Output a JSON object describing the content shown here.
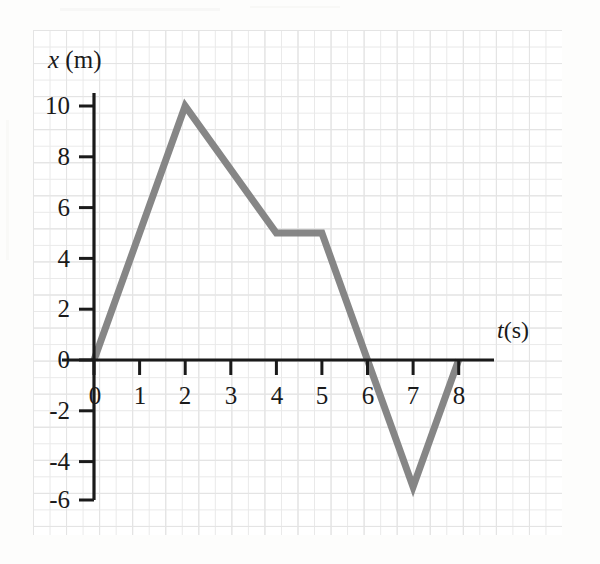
{
  "figure": {
    "type": "position-time-graph",
    "background_color": "#fdfdfc",
    "grid_color": "#dcdcdc",
    "axis_color": "#1a1a1a",
    "curve_color": "#808080"
  },
  "axes": {
    "y_axis_label": "x (m)",
    "y_axis_variable": "x",
    "y_axis_unit": "(m)",
    "x_axis_label": "t (s)",
    "x_axis_variable": "t",
    "x_axis_unit": "(s)"
  },
  "ticks": {
    "y": [
      "10",
      "8",
      "6",
      "4",
      "2",
      "0",
      "-2",
      "-4",
      "-6"
    ],
    "x": [
      "0",
      "1",
      "2",
      "3",
      "4",
      "5",
      "6",
      "7",
      "8"
    ]
  },
  "chart_data": {
    "type": "line",
    "title": "",
    "subtitle": "",
    "xlabel": "t (s)",
    "ylabel": "x (m)",
    "xlim": [
      -1,
      8.6
    ],
    "ylim": [
      -6.5,
      11
    ],
    "xticks": [
      0,
      1,
      2,
      3,
      4,
      5,
      6,
      7,
      8
    ],
    "yticks": [
      -6,
      -4,
      -2,
      0,
      2,
      4,
      6,
      8,
      10
    ],
    "grid": true,
    "minor_grid": true,
    "legend": null,
    "legend_position": "none",
    "annotations": [],
    "series": [
      {
        "name": "position",
        "color": "#808080",
        "linewidth": 7,
        "x": [
          0,
          2,
          4,
          5,
          6,
          7,
          8
        ],
        "values": [
          0,
          10,
          5,
          5,
          0,
          -5,
          0
        ]
      }
    ],
    "segments": [
      {
        "from_t": 0,
        "from_x": 0,
        "to_t": 2,
        "to_x": 10,
        "slope": 5
      },
      {
        "from_t": 2,
        "from_x": 10,
        "to_t": 4,
        "to_x": 5,
        "slope": -2.5
      },
      {
        "from_t": 4,
        "from_x": 5,
        "to_t": 5,
        "to_x": 5,
        "slope": 0
      },
      {
        "from_t": 5,
        "from_x": 5,
        "to_t": 6,
        "to_x": 0,
        "slope": -5
      },
      {
        "from_t": 6,
        "from_x": 0,
        "to_t": 7,
        "to_x": -5,
        "slope": -5
      },
      {
        "from_t": 7,
        "from_x": -5,
        "to_t": 8,
        "to_x": 0,
        "slope": 5
      }
    ]
  }
}
